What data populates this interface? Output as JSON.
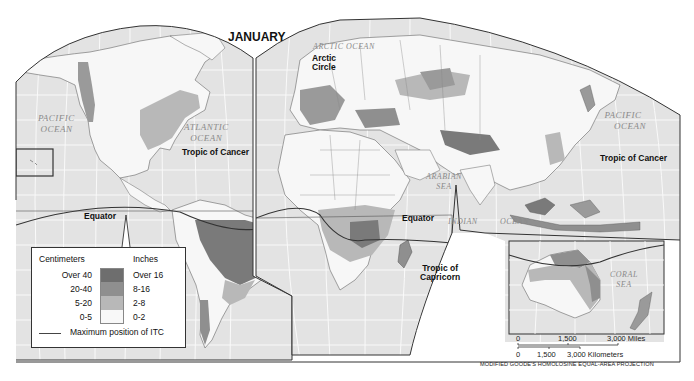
{
  "map": {
    "title": "JANUARY",
    "projection": "MODIFIED GOODE'S HOMOLOSINE EQUAL-AREA PROJECTION",
    "colors": {
      "ocean": "#e3e3e3",
      "land": "#f7f7f7",
      "precip_over_40": "#6e6e6e",
      "precip_20_40": "#8f8f8f",
      "precip_5_20": "#b8b8b8",
      "precip_0_5": "#f8f8f8",
      "border": "#444444"
    },
    "labels": {
      "arctic_circle": [
        "Arctic",
        "Circle"
      ],
      "tropic_of_cancer_west": "Tropic of Cancer",
      "tropic_of_cancer_east": "Tropic of Cancer",
      "equator_west": "Equator",
      "equator_east": "Equator",
      "tropic_of_capricorn": [
        "Tropic of",
        "Capricorn"
      ]
    },
    "oceans": {
      "arctic": "ARCTIC OCEAN",
      "pacific_west": [
        "PACIFIC",
        "OCEAN"
      ],
      "atlantic": [
        "ATLANTIC",
        "OCEAN"
      ],
      "pacific_east": [
        "PACIFIC",
        "OCEAN"
      ],
      "arabian_sea": [
        "ARABIAN",
        "SEA"
      ],
      "indian": "INDIAN",
      "ocean": "OCEAN",
      "coral_sea": [
        "CORAL",
        "SEA"
      ]
    }
  },
  "legend": {
    "header_cm": "Centimeters",
    "header_in": "Inches",
    "rows": [
      {
        "cm": "Over 40",
        "in": "Over 16",
        "color": "#6e6e6e"
      },
      {
        "cm": "20-40",
        "in": "8-16",
        "color": "#8f8f8f"
      },
      {
        "cm": "5-20",
        "in": "2-8",
        "color": "#b8b8b8"
      },
      {
        "cm": "0-5",
        "in": "0-2",
        "color": "#f8f8f8"
      }
    ],
    "itc_label": "Maximum position of ITC"
  },
  "scale": {
    "miles": {
      "zero": "0",
      "mid": "1,500",
      "max": "3,000 Miles"
    },
    "km": {
      "zero": "0",
      "mid": "1,500",
      "max": "3,000 Kilometers"
    }
  }
}
